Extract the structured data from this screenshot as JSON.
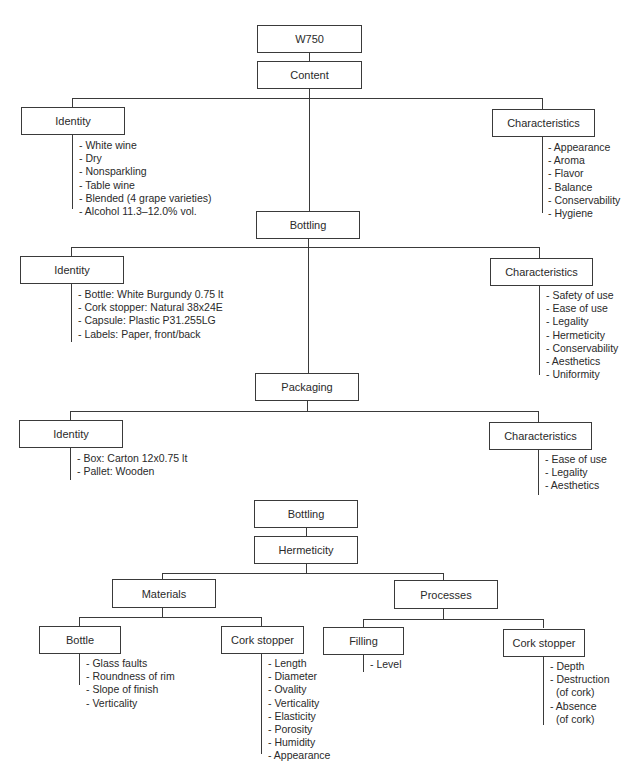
{
  "diagram": {
    "root": "W750",
    "content": {
      "label": "Content",
      "identity": {
        "label": "Identity",
        "items": [
          "- White wine",
          "- Dry",
          "- Nonsparkling",
          "- Table wine",
          "- Blended (4 grape varieties)",
          "- Alcohol 11.3–12.0% vol."
        ]
      },
      "characteristics": {
        "label": "Characteristics",
        "items": [
          "- Appearance",
          "- Aroma",
          "- Flavor",
          "- Balance",
          "- Conservability",
          "- Hygiene"
        ]
      }
    },
    "bottling": {
      "label": "Bottling",
      "identity": {
        "label": "Identity",
        "items": [
          "- Bottle: White Burgundy 0.75 lt",
          "- Cork stopper: Natural 38x24E",
          "- Capsule: Plastic P31.255LG",
          "- Labels: Paper, front/back"
        ]
      },
      "characteristics": {
        "label": "Characteristics",
        "items": [
          "- Safety of use",
          "- Ease of use",
          "- Legality",
          "- Hermeticity",
          "- Conservability",
          "- Aesthetics",
          "- Uniformity"
        ]
      }
    },
    "packaging": {
      "label": "Packaging",
      "identity": {
        "label": "Identity",
        "items": [
          "- Box: Carton 12x0.75 lt",
          "- Pallet: Wooden"
        ]
      },
      "characteristics": {
        "label": "Characteristics",
        "items": [
          "- Ease of use",
          "- Legality",
          "- Aesthetics"
        ]
      }
    },
    "hermeticity_tree": {
      "root": "Bottling",
      "child": "Hermeticity",
      "materials": {
        "label": "Materials",
        "bottle": {
          "label": "Bottle",
          "items": [
            "- Glass faults",
            "- Roundness of rim",
            "- Slope of finish",
            "- Verticality"
          ]
        },
        "cork_stopper": {
          "label": "Cork stopper",
          "items": [
            "- Length",
            "- Diameter",
            "- Ovality",
            "- Verticality",
            "- Elasticity",
            "- Porosity",
            "- Humidity",
            "- Appearance"
          ]
        }
      },
      "processes": {
        "label": "Processes",
        "filling": {
          "label": "Filling",
          "items": [
            "- Level"
          ]
        },
        "cork_stopper": {
          "label": "Cork stopper",
          "items": [
            "- Depth",
            "- Destruction",
            "(of cork)",
            "- Absence",
            "(of cork)"
          ]
        }
      }
    }
  }
}
